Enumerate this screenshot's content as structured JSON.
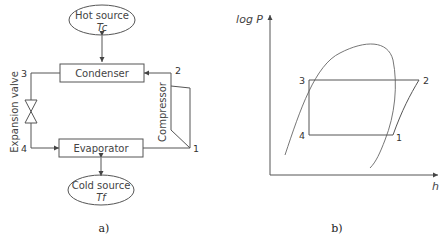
{
  "panel_a": {
    "caption": "a)",
    "hot_source": {
      "label": "Hot source",
      "temp": "Tc"
    },
    "cold_source": {
      "label": "Cold source",
      "temp": "Tf"
    },
    "condenser": "Condenser",
    "evaporator": "Evaporator",
    "compressor": "Compressor",
    "expansion_valve": "Expansion valve",
    "points": {
      "p1": "1",
      "p2": "2",
      "p3": "3",
      "p4": "4"
    }
  },
  "panel_b": {
    "caption": "b)",
    "y_axis": "log P",
    "x_axis": "h",
    "points": {
      "p1": "1",
      "p2": "2",
      "p3": "3",
      "p4": "4"
    }
  }
}
